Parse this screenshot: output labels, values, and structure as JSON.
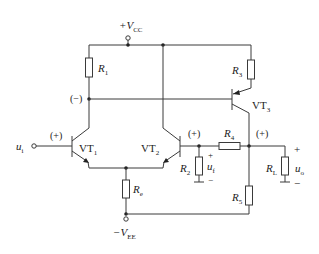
{
  "diagram": {
    "type": "circuit-schematic",
    "supply": {
      "positive": "+V",
      "positive_sub": "CC",
      "negative": "−V",
      "negative_sub": "EE"
    },
    "transistors": [
      {
        "id": "VT1",
        "label": "VT",
        "sub": "1",
        "type": "npn"
      },
      {
        "id": "VT2",
        "label": "VT",
        "sub": "2",
        "type": "npn"
      },
      {
        "id": "VT3",
        "label": "VT",
        "sub": "3",
        "type": "pnp"
      }
    ],
    "resistors": [
      {
        "id": "R1",
        "label": "R",
        "sub": "1"
      },
      {
        "id": "R2",
        "label": "R",
        "sub": "2"
      },
      {
        "id": "R3",
        "label": "R",
        "sub": "3"
      },
      {
        "id": "R4",
        "label": "R",
        "sub": "4"
      },
      {
        "id": "R5",
        "label": "R",
        "sub": "5"
      },
      {
        "id": "Re",
        "label": "R",
        "sub": "e"
      },
      {
        "id": "RL",
        "label": "R",
        "sub": "L"
      }
    ],
    "polarity_marks": {
      "vt1_base": "(+)",
      "vt1_collector": "(−)",
      "vt2_base": "(+)",
      "output_node": "(+)"
    },
    "signals": {
      "input": {
        "label": "u",
        "sub": "i"
      },
      "feedback": {
        "label": "u",
        "sub": "f",
        "plus": "+",
        "minus": "−"
      },
      "output": {
        "label": "u",
        "sub": "o",
        "plus": "+",
        "minus": "−"
      }
    }
  }
}
